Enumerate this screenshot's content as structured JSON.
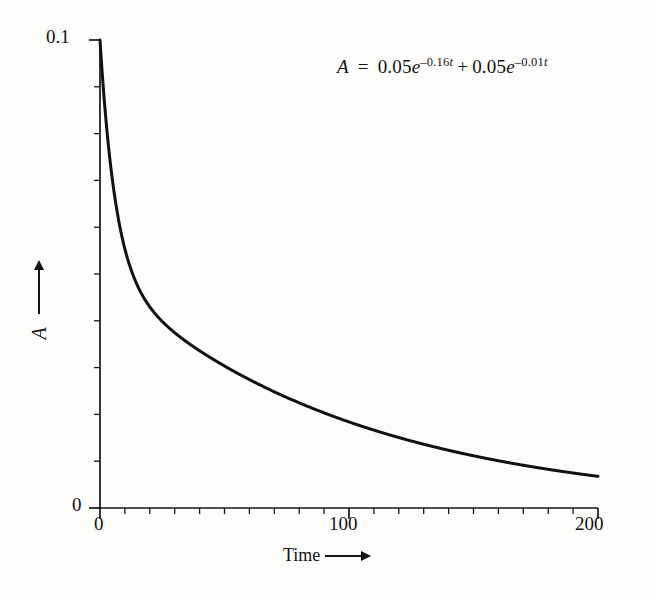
{
  "figure": {
    "background_color": "#fdfdfc",
    "ink_color": "#121212"
  },
  "annotation": {
    "equation_plain": "A = 0.05e^-0.16t + 0.05e^-0.01t",
    "lhs": "A",
    "equals": "=",
    "term1_coeff": "0.05",
    "term1_base": "e",
    "term1_exp_num": "–0.16",
    "term1_exp_var": "t",
    "plus": "+",
    "term2_coeff": "0.05",
    "term2_base": "e",
    "term2_exp_num": "–0.01",
    "term2_exp_var": "t"
  },
  "axes": {
    "x_title": "Time",
    "x_title_arrow": "arrow-right-icon",
    "y_title": "A",
    "y_title_arrow": "arrow-up-icon",
    "x_tick_labels": [
      "0",
      "100",
      "200"
    ],
    "y_tick_labels": [
      "0",
      "0.1"
    ],
    "x_min": 0,
    "x_max": 200,
    "y_min": 0,
    "y_max": 0.1,
    "x_major_ticks": [
      0,
      100,
      200
    ],
    "x_minor_interval": 10,
    "y_minor_count": 10
  },
  "chart_data": {
    "type": "line",
    "title": "",
    "subtitle": "",
    "xlabel": "Time",
    "ylabel": "A",
    "xlim": [
      0,
      200
    ],
    "ylim": [
      0,
      0.1
    ],
    "grid": false,
    "legend": false,
    "annotations": [
      "A = 0.05e^-0.16t + 0.05e^-0.01t"
    ],
    "equation": {
      "form": "biexponential_decay",
      "expression": "A(t) = 0.05*exp(-0.16*t) + 0.05*exp(-0.01*t)",
      "terms": [
        {
          "amplitude": 0.05,
          "rate": 0.16
        },
        {
          "amplitude": 0.05,
          "rate": 0.01
        }
      ]
    },
    "series": [
      {
        "name": "A(t)",
        "color": "#111111",
        "line_width": 3,
        "x": [
          0,
          2,
          4,
          6,
          8,
          10,
          12,
          15,
          20,
          25,
          30,
          40,
          50,
          60,
          70,
          80,
          90,
          100,
          110,
          120,
          130,
          140,
          150,
          160,
          170,
          180,
          190,
          200
        ],
        "y": [
          0.1,
          0.0853,
          0.0744,
          0.0662,
          0.0601,
          0.0554,
          0.0517,
          0.0476,
          0.043,
          0.0399,
          0.0376,
          0.0339,
          0.0305,
          0.0275,
          0.0248,
          0.0225,
          0.0203,
          0.0184,
          0.0166,
          0.0151,
          0.0136,
          0.0123,
          0.0112,
          0.0101,
          0.0091,
          0.0083,
          0.0075,
          0.0068
        ]
      }
    ]
  }
}
